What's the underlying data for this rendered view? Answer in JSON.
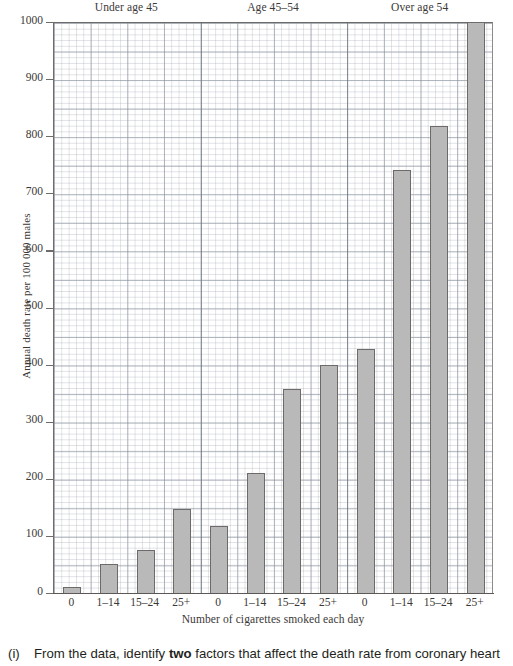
{
  "chart_data": {
    "type": "bar",
    "title": "",
    "xlabel": "Number of cigarettes smoked each day",
    "ylabel": "Annual death rate per 100 000 males",
    "ylim": [
      0,
      1000
    ],
    "ytick_step": 100,
    "grid": true,
    "legend_position": "none",
    "group_labels": [
      "Under age 45",
      "Age 45–54",
      "Over age 54"
    ],
    "categories": [
      "0",
      "1–14",
      "15–24",
      "25+"
    ],
    "ytick_labels": [
      "0",
      "100",
      "200",
      "300",
      "400",
      "500",
      "600",
      "700",
      "800",
      "900",
      "1000"
    ],
    "series": [
      {
        "name": "Under age 45",
        "categories": [
          "0",
          "1–14",
          "15–24",
          "25+"
        ],
        "values": [
          10,
          50,
          75,
          148
        ]
      },
      {
        "name": "Age 45–54",
        "categories": [
          "0",
          "1–14",
          "15–24",
          "25+"
        ],
        "values": [
          118,
          210,
          358,
          400
        ]
      },
      {
        "name": "Over age 54",
        "categories": [
          "0",
          "1–14",
          "15–24",
          "25+"
        ],
        "values": [
          428,
          740,
          818,
          1000
        ]
      }
    ],
    "bars": [
      {
        "group": "Under age 45",
        "category": "0",
        "value": 10,
        "clipped": false
      },
      {
        "group": "Under age 45",
        "category": "1–14",
        "value": 50,
        "clipped": false
      },
      {
        "group": "Under age 45",
        "category": "15–24",
        "value": 75,
        "clipped": false
      },
      {
        "group": "Under age 45",
        "category": "25+",
        "value": 148,
        "clipped": false
      },
      {
        "group": "Age 45–54",
        "category": "0",
        "value": 118,
        "clipped": false
      },
      {
        "group": "Age 45–54",
        "category": "1–14",
        "value": 210,
        "clipped": false
      },
      {
        "group": "Age 45–54",
        "category": "15–24",
        "value": 358,
        "clipped": false
      },
      {
        "group": "Age 45–54",
        "category": "25+",
        "value": 400,
        "clipped": false
      },
      {
        "group": "Over age 54",
        "category": "0",
        "value": 428,
        "clipped": false
      },
      {
        "group": "Over age 54",
        "category": "1–14",
        "value": 740,
        "clipped": false
      },
      {
        "group": "Over age 54",
        "category": "15–24",
        "value": 818,
        "clipped": false
      },
      {
        "group": "Over age 54",
        "category": "25+",
        "value": 1000,
        "clipped": true
      }
    ],
    "bar_color": "#b9b9b9",
    "bar_edge_color": "#6d6a68"
  },
  "question": {
    "marker": "(i)",
    "text_before_bold": "From the data, identify ",
    "bold": "two",
    "text_after_bold": " factors that affect the death rate from coronary heart"
  }
}
